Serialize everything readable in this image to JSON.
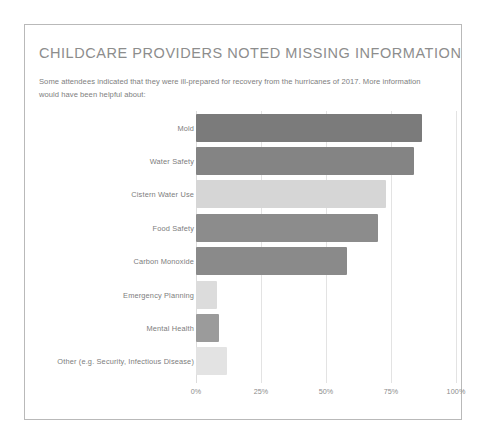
{
  "slide": {
    "title": "CHILDCARE PROVIDERS NOTED MISSING INFORMATION",
    "subtitle": "Some attendees indicated that they were ill-prepared for recovery from the hurricanes of 2017. More information would have been helpful about:"
  },
  "colors": {
    "title": "#8d8d8d",
    "subtitle": "#7e7e7e",
    "label": "#7d7d7d",
    "gridline": "#e3e3e3",
    "frame": "#b9b9b9",
    "background": "#ffffff"
  },
  "chart_data": {
    "type": "bar",
    "orientation": "horizontal",
    "title": "CHILDCARE PROVIDERS NOTED MISSING INFORMATION",
    "subtitle": "Some attendees indicated that they were ill-prepared for recovery from the hurricanes of 2017. More information would have been helpful about:",
    "xlabel": "",
    "ylabel": "",
    "xlim": [
      0,
      100
    ],
    "grid": true,
    "legend": false,
    "tick_labels": [
      "0%",
      "25%",
      "50%",
      "75%",
      "100%"
    ],
    "tick_values": [
      0,
      25,
      50,
      75,
      100
    ],
    "categories": [
      "Mold",
      "Water Safety",
      "Cistern Water Use",
      "Food Safety",
      "Carbon Monoxide",
      "Emergency Planning",
      "Mental Health",
      "Other (e.g. Security, Infectious Disease)"
    ],
    "values": [
      87,
      84,
      73,
      70,
      58,
      8,
      9,
      12
    ],
    "bar_colors": [
      "#7b7b7b",
      "#848484",
      "#d6d6d6",
      "#8c8c8c",
      "#8a8a8a",
      "#dcdcdc",
      "#9b9b9b",
      "#e3e3e3"
    ]
  }
}
